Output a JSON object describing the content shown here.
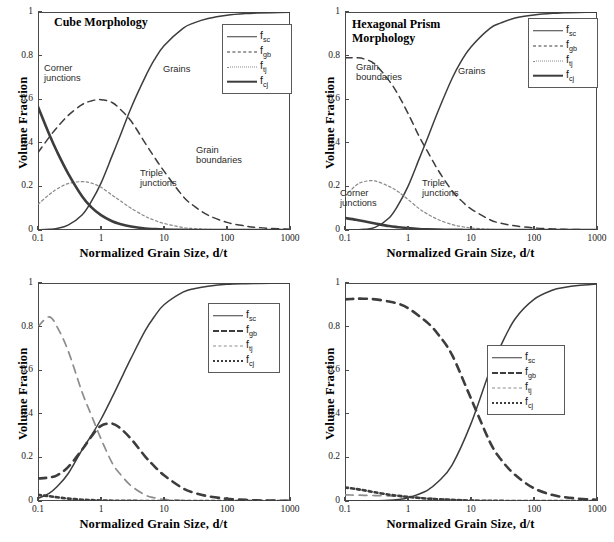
{
  "figure": {
    "axis": {
      "xlabel": "Normalized Grain Size, d/t",
      "ylabel": "Volume Fraction",
      "xticks": [
        "0.1",
        "1",
        "10",
        "100",
        "1000"
      ],
      "yticks": [
        "0",
        "0.2",
        "0.4",
        "0.6",
        "0.8",
        "1"
      ],
      "xlim": [
        0.1,
        1000
      ],
      "ylim": [
        0,
        1
      ],
      "xscale": "log",
      "frame_color": "#4a4a4a"
    },
    "legend_labels": {
      "fsc": "f",
      "fsc_sub": "sc",
      "fgb": "f",
      "fgb_sub": "gb",
      "ftj": "f",
      "ftj_sub": "tj",
      "fcj": "f",
      "fcj_sub": "cj"
    },
    "panels": [
      {
        "id": "cube-morphology",
        "title": "Cube Morphology",
        "annotations": [
          {
            "name": "corner-junctions",
            "text": "Corner\njunctions"
          },
          {
            "name": "grains",
            "text": "Grains"
          },
          {
            "name": "grain-boundaries",
            "text": "Grain\nboundaries"
          },
          {
            "name": "triple-junctions",
            "text": "Triple\njunctions"
          }
        ]
      },
      {
        "id": "hexagonal-prism-morphology",
        "title": "Hexagonal Prism\nMorphology",
        "annotations": [
          {
            "name": "grain-boundaries",
            "text": "Grain\nboundaries"
          },
          {
            "name": "grains",
            "text": "Grains"
          },
          {
            "name": "corner-junctions",
            "text": "Corner\njunctions"
          },
          {
            "name": "triple-junctions",
            "text": "Triple\njunctions"
          }
        ]
      },
      {
        "id": "hexagonal-alpha-10",
        "title": "Hexagonal, α = 10",
        "annotations": []
      },
      {
        "id": "hexagonal-alpha-0.1",
        "title": "Hexagonal, α = 0.1",
        "annotations": []
      }
    ]
  },
  "chart_data": [
    {
      "type": "line",
      "title": "Cube Morphology",
      "xlabel": "Normalized Grain Size, d/t",
      "ylabel": "Volume Fraction",
      "xscale": "log",
      "xlim": [
        0.1,
        1000
      ],
      "ylim": [
        0,
        1
      ],
      "grid": false,
      "legend_position": "upper right",
      "x": [
        0.1,
        0.15,
        0.2,
        0.3,
        0.5,
        0.7,
        1,
        1.5,
        2,
        3,
        5,
        7,
        10,
        20,
        30,
        50,
        100,
        200,
        300,
        500,
        1000
      ],
      "series": [
        {
          "name": "f_sc",
          "label": "Grains",
          "style": "solid-thin",
          "values": [
            0.001,
            0.003,
            0.007,
            0.022,
            0.069,
            0.13,
            0.215,
            0.34,
            0.43,
            0.56,
            0.7,
            0.78,
            0.845,
            0.925,
            0.95,
            0.97,
            0.985,
            0.993,
            0.995,
            0.997,
            0.999
          ]
        },
        {
          "name": "f_gb",
          "label": "Grain boundaries",
          "style": "dashed",
          "values": [
            0.355,
            0.425,
            0.47,
            0.525,
            0.575,
            0.592,
            0.598,
            0.585,
            0.555,
            0.5,
            0.4,
            0.335,
            0.27,
            0.155,
            0.11,
            0.068,
            0.035,
            0.018,
            0.012,
            0.007,
            0.004
          ]
        },
        {
          "name": "f_tj",
          "label": "Triple junctions",
          "style": "dotted",
          "values": [
            0.118,
            0.162,
            0.188,
            0.213,
            0.222,
            0.215,
            0.196,
            0.16,
            0.135,
            0.1,
            0.063,
            0.045,
            0.03,
            0.0115,
            0.0065,
            0.0028,
            0.0008,
            0.0002,
            0.0001,
            0.0,
            0.0
          ]
        },
        {
          "name": "f_cj",
          "label": "Corner junctions",
          "style": "solid-thick",
          "values": [
            0.565,
            0.44,
            0.36,
            0.26,
            0.155,
            0.105,
            0.068,
            0.04,
            0.028,
            0.016,
            0.007,
            0.0042,
            0.0022,
            0.0006,
            0.0003,
            0.0001,
            0.0,
            0.0,
            0.0,
            0.0,
            0.0
          ]
        }
      ]
    },
    {
      "type": "line",
      "title": "Hexagonal Prism Morphology",
      "xlabel": "Normalized Grain Size, d/t",
      "ylabel": "Volume Fraction",
      "xscale": "log",
      "xlim": [
        0.1,
        1000
      ],
      "ylim": [
        0,
        1
      ],
      "grid": false,
      "legend_position": "upper right",
      "x": [
        0.1,
        0.15,
        0.2,
        0.3,
        0.5,
        0.7,
        1,
        1.5,
        2,
        3,
        5,
        7,
        10,
        20,
        30,
        50,
        100,
        200,
        300,
        500,
        1000
      ],
      "series": [
        {
          "name": "f_sc",
          "label": "Grains",
          "style": "solid-thin",
          "values": [
            0.0,
            0.001,
            0.003,
            0.012,
            0.055,
            0.115,
            0.2,
            0.325,
            0.415,
            0.545,
            0.695,
            0.775,
            0.84,
            0.925,
            0.95,
            0.972,
            0.986,
            0.994,
            0.996,
            0.998,
            0.999
          ]
        },
        {
          "name": "f_gb",
          "label": "Grain boundaries",
          "style": "dashed",
          "values": [
            0.79,
            0.79,
            0.785,
            0.76,
            0.685,
            0.62,
            0.535,
            0.43,
            0.365,
            0.275,
            0.18,
            0.135,
            0.097,
            0.047,
            0.031,
            0.019,
            0.0095,
            0.005,
            0.003,
            0.002,
            0.001
          ]
        },
        {
          "name": "f_tj",
          "label": "Triple junctions",
          "style": "dotted",
          "values": [
            0.155,
            0.205,
            0.222,
            0.225,
            0.2,
            0.175,
            0.14,
            0.098,
            0.075,
            0.048,
            0.025,
            0.016,
            0.0095,
            0.003,
            0.0015,
            0.0006,
            0.0002,
            0.0,
            0.0,
            0.0,
            0.0
          ]
        },
        {
          "name": "f_cj",
          "label": "Corner junctions",
          "style": "solid-thick",
          "values": [
            0.055,
            0.047,
            0.04,
            0.03,
            0.018,
            0.013,
            0.0085,
            0.0048,
            0.0033,
            0.0018,
            0.0008,
            0.0004,
            0.0002,
            0.0,
            0.0,
            0.0,
            0.0,
            0.0,
            0.0,
            0.0,
            0.0
          ]
        }
      ]
    },
    {
      "type": "line",
      "title": "Hexagonal, α = 10",
      "xlabel": "Normalized Grain Size, d/t",
      "ylabel": "Volume Fraction",
      "xscale": "log",
      "xlim": [
        0.1,
        1000
      ],
      "ylim": [
        0,
        1
      ],
      "grid": false,
      "legend_position": "upper right",
      "x": [
        0.1,
        0.15,
        0.2,
        0.3,
        0.5,
        0.7,
        1,
        1.5,
        2,
        3,
        5,
        7,
        10,
        20,
        30,
        50,
        100,
        200,
        300,
        500,
        1000
      ],
      "series": [
        {
          "name": "f_sc",
          "style": "solid-thin",
          "values": [
            0.012,
            0.035,
            0.065,
            0.125,
            0.235,
            0.3,
            0.375,
            0.475,
            0.55,
            0.655,
            0.78,
            0.845,
            0.9,
            0.958,
            0.974,
            0.985,
            0.994,
            0.997,
            0.998,
            0.999,
            1.0
          ]
        },
        {
          "name": "f_gb",
          "style": "dashed-thick",
          "values": [
            0.103,
            0.108,
            0.118,
            0.155,
            0.235,
            0.295,
            0.345,
            0.355,
            0.335,
            0.285,
            0.205,
            0.16,
            0.118,
            0.058,
            0.038,
            0.022,
            0.01,
            0.005,
            0.003,
            0.002,
            0.001
          ]
        },
        {
          "name": "f_tj",
          "style": "dashed-light",
          "values": [
            0.8,
            0.845,
            0.8,
            0.69,
            0.5,
            0.395,
            0.285,
            0.175,
            0.125,
            0.07,
            0.028,
            0.015,
            0.0075,
            0.0015,
            0.0006,
            0.0002,
            0.0,
            0.0,
            0.0,
            0.0,
            0.0
          ]
        },
        {
          "name": "f_cj",
          "style": "dotted-thick",
          "values": [
            0.028,
            0.022,
            0.017,
            0.011,
            0.006,
            0.004,
            0.0025,
            0.0014,
            0.0009,
            0.0005,
            0.0002,
            0.0001,
            0.0,
            0.0,
            0.0,
            0.0,
            0.0,
            0.0,
            0.0,
            0.0,
            0.0
          ]
        }
      ]
    },
    {
      "type": "line",
      "title": "Hexagonal, α = 0.1",
      "xlabel": "Normalized Grain Size, d/t",
      "ylabel": "Volume Fraction",
      "xscale": "log",
      "xlim": [
        0.1,
        1000
      ],
      "ylim": [
        0,
        1
      ],
      "grid": false,
      "legend_position": "center right",
      "x": [
        0.1,
        0.15,
        0.2,
        0.3,
        0.5,
        0.7,
        1,
        2,
        3,
        5,
        10,
        20,
        30,
        50,
        100,
        200,
        300,
        500,
        1000
      ],
      "series": [
        {
          "name": "f_sc",
          "style": "solid-thin",
          "values": [
            0.0,
            0.0,
            0.0,
            0.001,
            0.003,
            0.007,
            0.015,
            0.048,
            0.088,
            0.165,
            0.355,
            0.6,
            0.715,
            0.835,
            0.925,
            0.968,
            0.979,
            0.988,
            0.995
          ]
        },
        {
          "name": "f_gb",
          "style": "dashed-thick",
          "values": [
            0.925,
            0.928,
            0.928,
            0.925,
            0.915,
            0.905,
            0.885,
            0.82,
            0.765,
            0.67,
            0.47,
            0.27,
            0.19,
            0.12,
            0.058,
            0.027,
            0.018,
            0.011,
            0.005
          ]
        },
        {
          "name": "f_tj",
          "style": "dashed-light",
          "values": [
            0.028,
            0.027,
            0.026,
            0.025,
            0.023,
            0.021,
            0.019,
            0.013,
            0.01,
            0.0065,
            0.003,
            0.0012,
            0.0007,
            0.0004,
            0.0001,
            0.0,
            0.0,
            0.0,
            0.0
          ]
        },
        {
          "name": "f_cj",
          "style": "dotted-thick",
          "values": [
            0.062,
            0.055,
            0.049,
            0.04,
            0.029,
            0.024,
            0.019,
            0.011,
            0.008,
            0.005,
            0.002,
            0.0008,
            0.0004,
            0.0002,
            0.0,
            0.0,
            0.0,
            0.0,
            0.0
          ]
        }
      ]
    }
  ]
}
